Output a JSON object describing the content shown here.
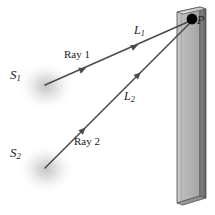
{
  "figure": {
    "background_color": "#ffffff",
    "labels": {
      "source1": {
        "base": "S",
        "subscript": "1"
      },
      "source2": {
        "base": "S",
        "subscript": "2"
      },
      "path1": {
        "base": "L",
        "subscript": "1"
      },
      "path2": {
        "base": "L",
        "subscript": "2"
      },
      "point_p": "P",
      "ray1": "Ray 1",
      "ray2": "Ray 2"
    },
    "colors": {
      "ray_stroke": "#4a4a4a",
      "point_p_fill": "#000000",
      "wall_front": "#b9b9b9",
      "wall_front_shade": "#a8a8a8",
      "wall_edge_dark": "#6f6f6f",
      "wall_top": "#d8d8d8",
      "wall_outline": "#555555",
      "source_glow": "#c9c9c9",
      "text": "#1b1b1b"
    },
    "geometry": {
      "canvas": {
        "width": 215,
        "height": 215
      },
      "point_p": {
        "x": 192,
        "y": 19,
        "radius": 5.2
      },
      "source1": {
        "x": 45,
        "y": 85,
        "glow_radius": 27
      },
      "source2": {
        "x": 45,
        "y": 168,
        "glow_radius": 27
      },
      "ray1": {
        "x1": 45,
        "y1": 85,
        "x2": 190,
        "y2": 21
      },
      "ray2": {
        "x1": 45,
        "y1": 168,
        "x2": 190,
        "y2": 23
      },
      "ray1_arrow_positions": [
        0.28,
        0.64
      ],
      "ray2_arrow_positions": [
        0.28,
        0.66
      ],
      "wall": {
        "front_top_left": {
          "x": 177,
          "y": 12
        },
        "front_top_right": {
          "x": 200,
          "y": 7
        },
        "front_bottom_right": {
          "x": 200,
          "y": 196
        },
        "front_bottom_left": {
          "x": 177,
          "y": 203
        },
        "edge_top_right": {
          "x": 206,
          "y": 9
        },
        "edge_bottom_right": {
          "x": 206,
          "y": 198
        }
      }
    }
  }
}
